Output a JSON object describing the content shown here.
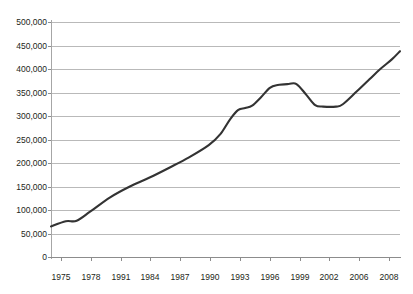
{
  "chart_data": {
    "type": "line",
    "title": "",
    "subtitle": "",
    "xlabel": "",
    "ylabel": "",
    "ylim": [
      0,
      500000
    ],
    "ytick_labels": [
      "0",
      "50,000",
      "100,000",
      "150,000",
      "200,000",
      "250,000",
      "300,000",
      "350,000",
      "400,000",
      "450,000",
      "500,000"
    ],
    "ytick_values": [
      0,
      50000,
      100000,
      150000,
      200000,
      250000,
      300000,
      350000,
      400000,
      450000,
      500000
    ],
    "xtick_labels": [
      "1975",
      "1978",
      "1991",
      "1984",
      "1987",
      "1990",
      "1993",
      "1996",
      "1999",
      "2002",
      "2006",
      "2008"
    ],
    "grid": "horizontal",
    "legend": "none",
    "line_color": "#333333",
    "grid_color": "#b9b9b9",
    "axis_color": "#8c8c8c",
    "categories": [
      "1975",
      "1976",
      "1977",
      "1978",
      "1979",
      "1980",
      "1981",
      "1982",
      "1983",
      "1984",
      "1985",
      "1986",
      "1987",
      "1988",
      "1989",
      "1990",
      "1991",
      "1992",
      "1993",
      "1994",
      "1995",
      "1996",
      "1997",
      "1998",
      "1999",
      "2000",
      "2001",
      "2002",
      "2003",
      "2004",
      "2005",
      "2006",
      "2007",
      "2008"
    ],
    "values": [
      65000,
      72000,
      77000,
      78000,
      97000,
      116000,
      131000,
      144000,
      156000,
      166000,
      176000,
      186000,
      197000,
      208000,
      219000,
      232000,
      250000,
      272000,
      292000,
      311000,
      317000,
      320000,
      331000,
      348000,
      362000,
      367000,
      368000,
      368000,
      348000,
      329000,
      321000,
      320000,
      320000,
      325000
    ],
    "points": [
      {
        "x": 1975,
        "y": 65000
      },
      {
        "x": 1976.5,
        "y": 76000
      },
      {
        "x": 1977.6,
        "y": 77000
      },
      {
        "x": 1979,
        "y": 97000
      },
      {
        "x": 1981,
        "y": 127000
      },
      {
        "x": 1983,
        "y": 150000
      },
      {
        "x": 1985,
        "y": 169000
      },
      {
        "x": 1987,
        "y": 190000
      },
      {
        "x": 1989,
        "y": 212000
      },
      {
        "x": 1991,
        "y": 238000
      },
      {
        "x": 1992.2,
        "y": 262000
      },
      {
        "x": 1993.2,
        "y": 294000
      },
      {
        "x": 1994,
        "y": 313000
      },
      {
        "x": 1994.7,
        "y": 317000
      },
      {
        "x": 1995.4,
        "y": 322000
      },
      {
        "x": 1996.3,
        "y": 340000
      },
      {
        "x": 1997.2,
        "y": 360000
      },
      {
        "x": 1998,
        "y": 366000
      },
      {
        "x": 1999.1,
        "y": 368000
      },
      {
        "x": 1999.9,
        "y": 368000
      },
      {
        "x": 2000.9,
        "y": 345000
      },
      {
        "x": 2001.8,
        "y": 323000
      },
      {
        "x": 2002.6,
        "y": 320000
      },
      {
        "x": 2003.9,
        "y": 320000
      },
      {
        "x": 2004.6,
        "y": 325000
      },
      {
        "x": 2006,
        "y": 352000
      },
      {
        "x": 2007.3,
        "y": 378000
      },
      {
        "x": 2008.4,
        "y": 400000
      },
      {
        "x": 2009.6,
        "y": 421000
      },
      {
        "x": 2010.4,
        "y": 438000
      }
    ],
    "annotations": {
      "start_value": 65000,
      "early_plateau_value": 77000,
      "shoulder_value": 317000,
      "peak_value": 368000,
      "trough_value": 320000,
      "end_value": 438000
    }
  }
}
